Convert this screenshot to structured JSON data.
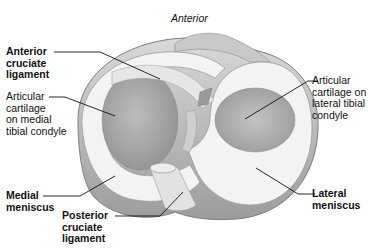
{
  "figure": {
    "orientation_label": "Anterior",
    "labels": {
      "anterior_cruciate_ligament": "Anterior\ncruciate\nligament",
      "articular_cartilage_medial": "Articular\ncartilage\non medial\ntibial condyle",
      "articular_cartilage_lateral": "Articular\ncartilage on\nlateral tibial\ncondyle",
      "medial_meniscus": "Medial\nmeniscus",
      "posterior_cruciate_ligament": "Posterior\ncruciate\nligament",
      "lateral_meniscus": "Lateral\nmeniscus"
    },
    "colors": {
      "background": "#ffffff",
      "meniscus": "#f1f1f1",
      "cartilage": "#a9a9a9",
      "tibia_edge": "#8a8a8a",
      "ligament": "#e4e4e4",
      "leader_line": "#111111"
    }
  }
}
